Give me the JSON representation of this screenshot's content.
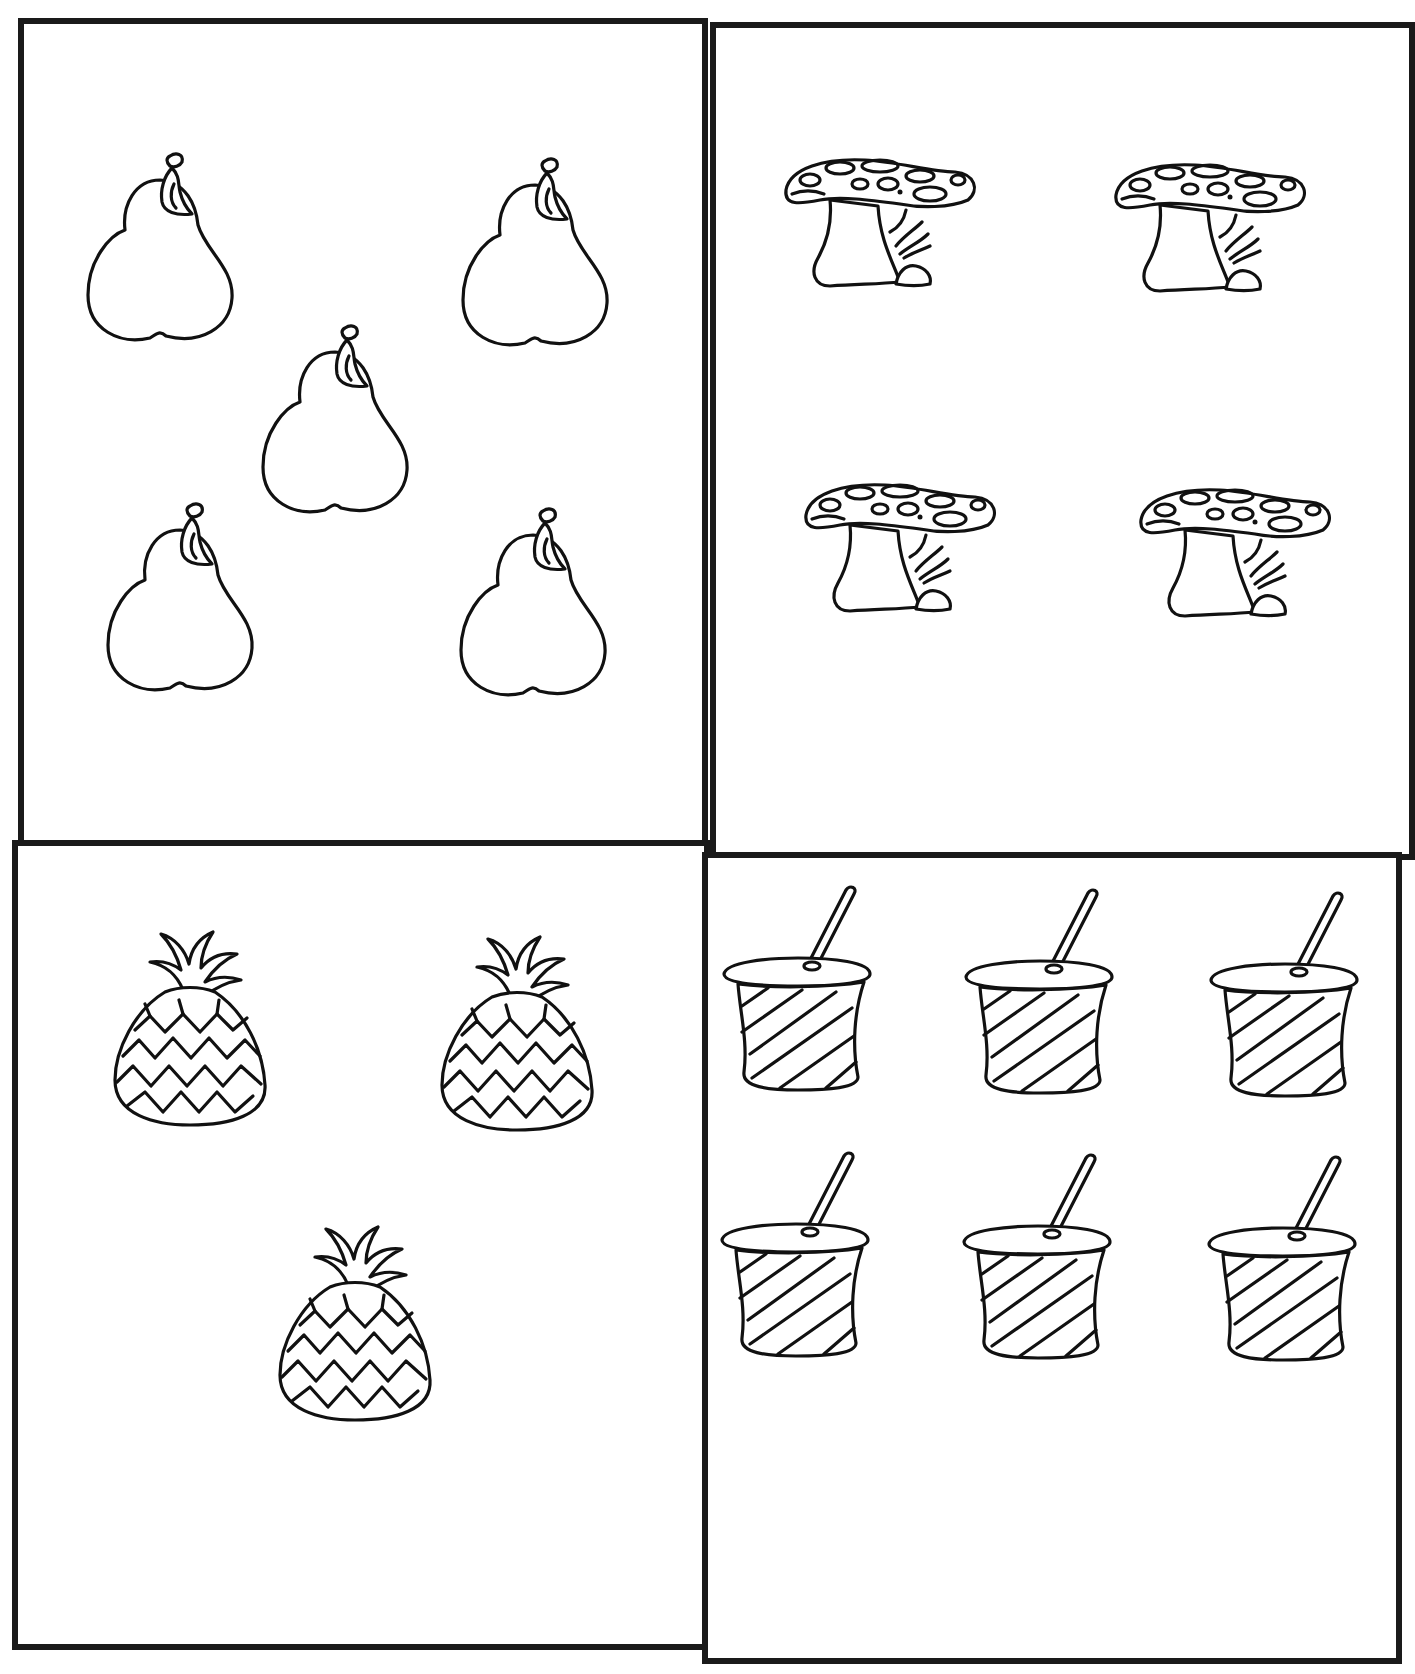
{
  "worksheet": {
    "type": "counting-worksheet",
    "background": "#ffffff",
    "line_color": "#111111",
    "quadrants": [
      {
        "id": "pears",
        "object": "pear",
        "icon": "pear-icon",
        "count": 5,
        "box": {
          "x": 18,
          "y": 18,
          "w": 690,
          "h": 830
        },
        "items": [
          {
            "x": 80,
            "y": 150,
            "w": 160,
            "h": 200
          },
          {
            "x": 455,
            "y": 155,
            "w": 160,
            "h": 200
          },
          {
            "x": 255,
            "y": 322,
            "w": 160,
            "h": 200
          },
          {
            "x": 100,
            "y": 500,
            "w": 160,
            "h": 200
          },
          {
            "x": 453,
            "y": 505,
            "w": 160,
            "h": 200
          }
        ]
      },
      {
        "id": "mushrooms",
        "object": "mushroom",
        "icon": "mushroom-icon",
        "count": 4,
        "box": {
          "x": 710,
          "y": 22,
          "w": 705,
          "h": 838
        },
        "items": [
          {
            "x": 780,
            "y": 150,
            "w": 200,
            "h": 145
          },
          {
            "x": 1110,
            "y": 155,
            "w": 200,
            "h": 145
          },
          {
            "x": 800,
            "y": 475,
            "w": 200,
            "h": 145
          },
          {
            "x": 1135,
            "y": 480,
            "w": 200,
            "h": 145
          }
        ]
      },
      {
        "id": "pineapples",
        "object": "pineapple",
        "icon": "pineapple-icon",
        "count": 3,
        "box": {
          "x": 12,
          "y": 840,
          "w": 698,
          "h": 810
        },
        "items": [
          {
            "x": 105,
            "y": 920,
            "w": 170,
            "h": 215
          },
          {
            "x": 432,
            "y": 925,
            "w": 170,
            "h": 215
          },
          {
            "x": 270,
            "y": 1215,
            "w": 170,
            "h": 215
          }
        ]
      },
      {
        "id": "cups",
        "object": "cup-with-straw",
        "icon": "cup-with-straw-icon",
        "count": 6,
        "box": {
          "x": 702,
          "y": 852,
          "w": 700,
          "h": 812
        },
        "items": [
          {
            "x": 718,
            "y": 882,
            "w": 160,
            "h": 220
          },
          {
            "x": 960,
            "y": 885,
            "w": 160,
            "h": 220
          },
          {
            "x": 1205,
            "y": 888,
            "w": 160,
            "h": 220
          },
          {
            "x": 716,
            "y": 1148,
            "w": 160,
            "h": 220
          },
          {
            "x": 958,
            "y": 1150,
            "w": 160,
            "h": 220
          },
          {
            "x": 1203,
            "y": 1152,
            "w": 160,
            "h": 220
          }
        ]
      }
    ]
  }
}
